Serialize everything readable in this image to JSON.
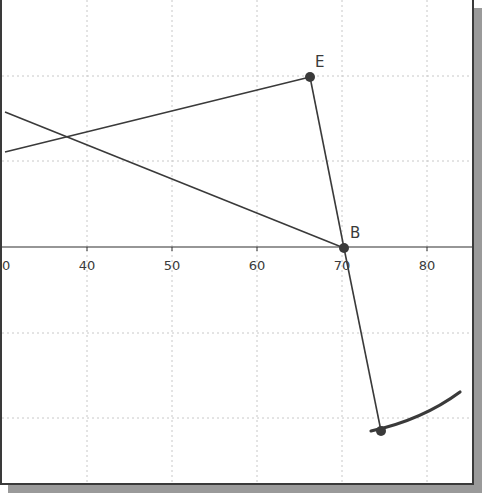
{
  "diagram": {
    "type": "geometry-construction",
    "x_axis": {
      "tick_labels": [
        "30",
        "40",
        "50",
        "60",
        "70",
        "80"
      ],
      "tick_positions_px": [
        0,
        85,
        170,
        255,
        340,
        425
      ],
      "y_px": 247
    },
    "grid": {
      "vertical_px": [
        85,
        170,
        255,
        340,
        425
      ],
      "horizontal_px": [
        76,
        161,
        333,
        418
      ]
    },
    "points": [
      {
        "id": "E",
        "label": "E",
        "x": 308,
        "y": 77
      },
      {
        "id": "B",
        "label": "B",
        "x": 342,
        "y": 248
      },
      {
        "id": "P",
        "label": "",
        "x": 379,
        "y": 431
      }
    ],
    "segments": [
      {
        "id": "line-to-B",
        "from": [
          3,
          112
        ],
        "to": [
          342,
          248
        ]
      },
      {
        "id": "line-to-E",
        "from": [
          3,
          152
        ],
        "to": [
          308,
          77
        ]
      },
      {
        "id": "EB",
        "from": [
          308,
          77
        ],
        "to": [
          342,
          248
        ]
      },
      {
        "id": "BP",
        "from": [
          342,
          248
        ],
        "to": [
          379,
          431
        ]
      }
    ],
    "arc": {
      "path": "M 369 431 Q 420 420 458 392"
    },
    "colors": {
      "stroke": "#3a3a3a",
      "grid": "#c8c8c8",
      "background": "#ffffff"
    }
  }
}
